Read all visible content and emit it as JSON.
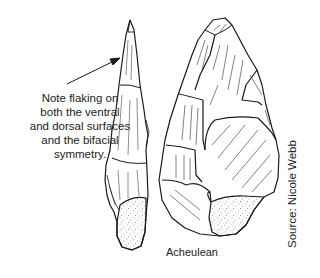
{
  "figure": {
    "annotation": {
      "lines": [
        "Note flaking on",
        "both the ventral",
        "and dorsal surfaces",
        "and the bifacial",
        "symmetry."
      ],
      "pointer": "arrow-pointing-to-side-view"
    },
    "caption": "Acheulean",
    "source": "Source: Nicole Webb",
    "tools": [
      {
        "view": "side-profile",
        "description": "narrow side view of hand axe with cortex at base"
      },
      {
        "view": "face",
        "description": "Acheulean hand axe face view with flake scars and stippled cortex"
      }
    ],
    "colors": {
      "line": "#1a1a1a",
      "background": "#ffffff",
      "cortex_stipple": "#333333"
    }
  }
}
